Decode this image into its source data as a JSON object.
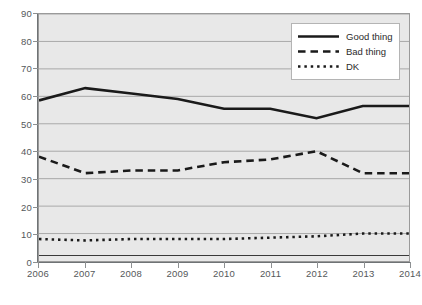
{
  "chart_data": {
    "type": "line",
    "title": "",
    "subtitle": "",
    "xlabel": "",
    "ylabel": "",
    "x": [
      2006,
      2007,
      2008,
      2009,
      2010,
      2011,
      2012,
      2013,
      2014
    ],
    "categories": [
      "2006",
      "2007",
      "2008",
      "2009",
      "2010",
      "2011",
      "2012",
      "2013",
      "2014"
    ],
    "xlim": [
      2006,
      2014
    ],
    "ylim": [
      0,
      90
    ],
    "y_ticks": [
      0,
      10,
      20,
      30,
      40,
      50,
      60,
      70,
      80,
      90
    ],
    "y_tick_labels": [
      "0",
      "10",
      "20",
      "30",
      "40",
      "50",
      "60",
      "70",
      "80",
      "90"
    ],
    "grid": "horizontal",
    "legend_position": "top-right",
    "plot_background": "#e8e8e8",
    "series": [
      {
        "name": "Good thing",
        "style": "solid",
        "color": "#1a1a1a",
        "width": 2.6,
        "values": [
          58.5,
          63,
          61,
          59,
          55.5,
          55.5,
          52,
          56.5,
          56.5
        ]
      },
      {
        "name": "Bad thing",
        "style": "dashed",
        "color": "#1a1a1a",
        "width": 2.6,
        "values": [
          38,
          32,
          33,
          33,
          36,
          37,
          40,
          32,
          32
        ]
      },
      {
        "name": "DK",
        "style": "dotted",
        "color": "#1a1a1a",
        "width": 2.6,
        "values": [
          8,
          7.5,
          8,
          8,
          8,
          8.5,
          9,
          10,
          10
        ]
      },
      {
        "name": "",
        "style": "solid",
        "color": "#3a3a3a",
        "width": 1.2,
        "values": [
          2,
          2,
          2,
          2,
          2,
          2,
          2,
          2,
          2
        ]
      }
    ]
  },
  "legend": {
    "entries": [
      {
        "label": "Good thing",
        "style": "solid"
      },
      {
        "label": "Bad thing",
        "style": "dashed"
      },
      {
        "label": "DK",
        "style": "dotted"
      }
    ]
  }
}
